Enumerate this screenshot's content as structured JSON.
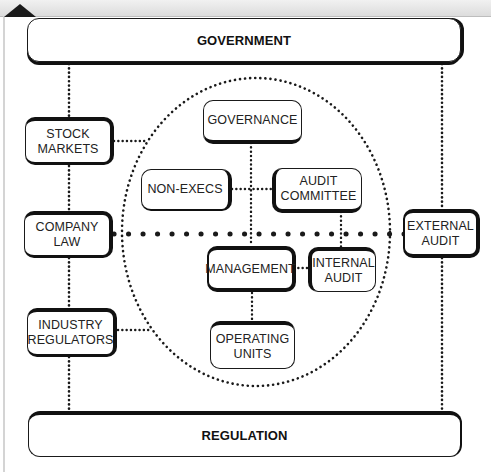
{
  "diagram": {
    "outer_boxes": {
      "government": "GOVERNMENT",
      "regulation": "REGULATION"
    },
    "left_boxes": [
      {
        "id": "stock-markets",
        "label": "STOCK\nMARKETS"
      },
      {
        "id": "company-law",
        "label": "COMPANY\nLAW"
      },
      {
        "id": "industry-regulators",
        "label": "INDUSTRY\nREGULATORS"
      }
    ],
    "right_boxes": [
      {
        "id": "external-audit",
        "label": "EXTERNAL\nAUDIT"
      }
    ],
    "inner_boxes": [
      {
        "id": "governance",
        "label": "GOVERNANCE"
      },
      {
        "id": "non-execs",
        "label": "NON-EXECS"
      },
      {
        "id": "audit-committee",
        "label": "AUDIT\nCOMMITTEE"
      },
      {
        "id": "management",
        "label": "MANAGEMENT"
      },
      {
        "id": "internal-audit",
        "label": "INTERNAL\nAUDIT"
      },
      {
        "id": "operating-units",
        "label": "OPERATING\nUNITS"
      }
    ],
    "connections": [
      [
        "government",
        "stock-markets"
      ],
      [
        "stock-markets",
        "company-law"
      ],
      [
        "company-law",
        "industry-regulators"
      ],
      [
        "industry-regulators",
        "regulation"
      ],
      [
        "government",
        "external-audit"
      ],
      [
        "external-audit",
        "regulation"
      ],
      [
        "stock-markets",
        "boundary"
      ],
      [
        "industry-regulators",
        "boundary"
      ],
      [
        "company-law",
        "external-audit"
      ],
      [
        "governance",
        "management"
      ],
      [
        "non-execs",
        "audit-committee"
      ],
      [
        "audit-committee",
        "internal-audit"
      ],
      [
        "management",
        "internal-audit"
      ],
      [
        "management",
        "operating-units"
      ]
    ],
    "colors": {
      "line": "#1a1a1a",
      "background": "#ffffff",
      "strip": "#e0e0e0"
    }
  }
}
